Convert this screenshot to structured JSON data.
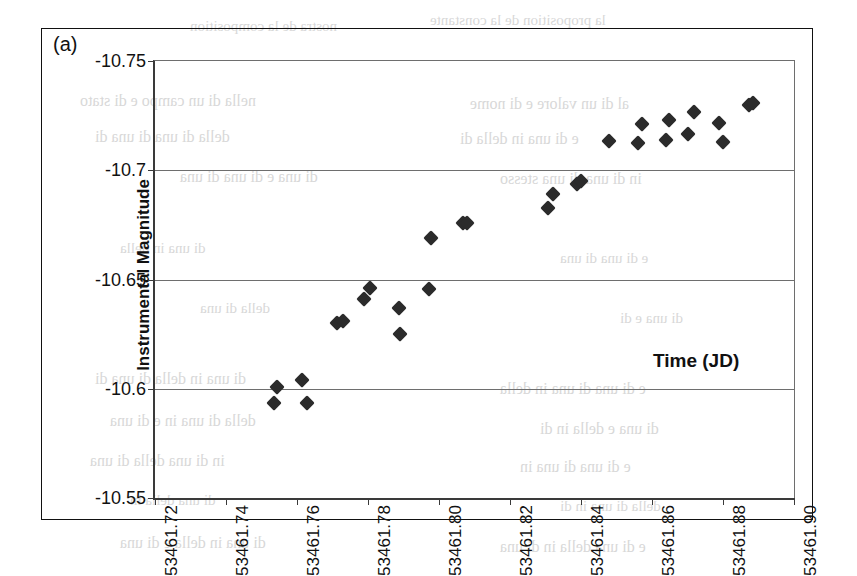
{
  "figure": {
    "panel_label": "(a)",
    "background": "#ffffff",
    "frame_color": "#111111",
    "marker_color": "#2b2b2b",
    "gridline_color": "#6e6e6e"
  },
  "chart_data": {
    "type": "scatter",
    "title": "",
    "xlabel": "Time (JD)",
    "ylabel": "Instrumental Magnitude",
    "xlim": [
      53461.72,
      53461.9
    ],
    "ylim": [
      -10.55,
      -10.75
    ],
    "y_inverted": true,
    "grid": true,
    "legend": "none",
    "xticks": [
      53461.72,
      53461.74,
      53461.76,
      53461.78,
      53461.8,
      53461.82,
      53461.84,
      53461.86,
      53461.88,
      53461.9
    ],
    "xticklabels": [
      "53461.72",
      "53461.74",
      "53461.76",
      "53461.78",
      "53461.80",
      "53461.82",
      "53461.84",
      "53461.86",
      "53461.88",
      "53461.90"
    ],
    "xtick_rotation": -90,
    "yticks": [
      -10.75,
      -10.7,
      -10.65,
      -10.6,
      -10.55
    ],
    "yticklabels": [
      "-10.75",
      "-10.7",
      "-10.65",
      "-10.6",
      "-10.55"
    ],
    "marker": "diamond",
    "marker_size": 11,
    "series": [
      {
        "name": "Instrumental magnitude",
        "points": [
          {
            "x": 53461.7545,
            "y": -10.6007
          },
          {
            "x": 53461.7534,
            "y": -10.5937
          },
          {
            "x": 53461.7613,
            "y": -10.604
          },
          {
            "x": 53461.7627,
            "y": -10.5937
          },
          {
            "x": 53461.7713,
            "y": -10.6303
          },
          {
            "x": 53461.773,
            "y": -10.6312
          },
          {
            "x": 53461.779,
            "y": -10.6411
          },
          {
            "x": 53461.7807,
            "y": -10.6461
          },
          {
            "x": 53461.7888,
            "y": -10.6369
          },
          {
            "x": 53461.789,
            "y": -10.625
          },
          {
            "x": 53461.7972,
            "y": -10.6457
          },
          {
            "x": 53461.7978,
            "y": -10.6691
          },
          {
            "x": 53461.8068,
            "y": -10.676
          },
          {
            "x": 53461.8078,
            "y": -10.676
          },
          {
            "x": 53461.832,
            "y": -10.689
          },
          {
            "x": 53461.8308,
            "y": -10.6826
          },
          {
            "x": 53461.839,
            "y": -10.6938
          },
          {
            "x": 53461.84,
            "y": -10.695
          },
          {
            "x": 53461.8478,
            "y": -10.7135
          },
          {
            "x": 53461.856,
            "y": -10.7126
          },
          {
            "x": 53461.8572,
            "y": -10.721
          },
          {
            "x": 53461.864,
            "y": -10.714
          },
          {
            "x": 53461.8648,
            "y": -10.723
          },
          {
            "x": 53461.87,
            "y": -10.7165
          },
          {
            "x": 53461.8718,
            "y": -10.7265
          },
          {
            "x": 53461.879,
            "y": -10.7215
          },
          {
            "x": 53461.88,
            "y": -10.713
          },
          {
            "x": 53461.8872,
            "y": -10.73
          },
          {
            "x": 53461.8885,
            "y": -10.731
          }
        ]
      }
    ]
  },
  "bleed_text": [
    {
      "text": "nostra de la composition",
      "x": 190,
      "y": 18,
      "size": 15
    },
    {
      "text": "la proposition de la constante",
      "x": 430,
      "y": 12,
      "size": 15
    },
    {
      "text": "nella di un campo e di stato",
      "x": 80,
      "y": 92,
      "size": 16
    },
    {
      "text": "al di un valore e di nome",
      "x": 470,
      "y": 95,
      "size": 16
    },
    {
      "text": "della di una di una di",
      "x": 95,
      "y": 128,
      "size": 16
    },
    {
      "text": "e di una in della di",
      "x": 460,
      "y": 130,
      "size": 16
    },
    {
      "text": "di una e di una di una",
      "x": 180,
      "y": 168,
      "size": 16
    },
    {
      "text": "in di una di una stesso",
      "x": 500,
      "y": 170,
      "size": 16
    },
    {
      "text": "di una in della",
      "x": 120,
      "y": 240,
      "size": 15
    },
    {
      "text": "e di una di una",
      "x": 560,
      "y": 250,
      "size": 15
    },
    {
      "text": "della di una",
      "x": 200,
      "y": 300,
      "size": 15
    },
    {
      "text": "di una e di",
      "x": 620,
      "y": 310,
      "size": 15
    },
    {
      "text": "di una in della di una di",
      "x": 95,
      "y": 370,
      "size": 16
    },
    {
      "text": "e di una di una in della",
      "x": 500,
      "y": 380,
      "size": 16
    },
    {
      "text": "della di una in e di una",
      "x": 110,
      "y": 412,
      "size": 16
    },
    {
      "text": "di una e della in di",
      "x": 540,
      "y": 420,
      "size": 16
    },
    {
      "text": "in di una della di una",
      "x": 90,
      "y": 452,
      "size": 16
    },
    {
      "text": "e di una di una in",
      "x": 520,
      "y": 458,
      "size": 16
    },
    {
      "text": "di una della in",
      "x": 130,
      "y": 492,
      "size": 15
    },
    {
      "text": "della di una in di",
      "x": 560,
      "y": 498,
      "size": 15
    },
    {
      "text": "di una in della e di una",
      "x": 120,
      "y": 534,
      "size": 16
    },
    {
      "text": "e di una della in di una",
      "x": 500,
      "y": 538,
      "size": 16
    }
  ]
}
